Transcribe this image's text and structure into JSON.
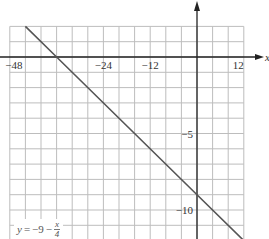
{
  "chart_data": {
    "type": "line",
    "title": "",
    "equation": "y = -9 - x/4",
    "xlabel": "x",
    "ylabel": "y",
    "xlim": [
      -48,
      12
    ],
    "ylim": [
      -12,
      2
    ],
    "grid": true,
    "x_grid_step": 4,
    "y_grid_step": 1,
    "x_ticks": [
      {
        "value": -48,
        "label": "−48"
      },
      {
        "value": -24,
        "label": "−24"
      },
      {
        "value": -12,
        "label": "−12"
      },
      {
        "value": 12,
        "label": "12"
      }
    ],
    "y_ticks": [
      {
        "value": -5,
        "label": "−5"
      },
      {
        "value": -10,
        "label": "−10"
      }
    ],
    "series": [
      {
        "name": "y = -9 - x/4",
        "x": [
          -44,
          -36,
          0,
          12
        ],
        "y": [
          2,
          0,
          -9,
          -12
        ],
        "color": "#555555"
      }
    ],
    "legend": {
      "position": "bottom-left",
      "lhs": "y",
      "eq": "=",
      "const": "−9",
      "minus": "−",
      "frac_num": "x",
      "frac_den": "4"
    }
  },
  "colors": {
    "grid": "#bdbdbd",
    "axis": "#222222",
    "line": "#555555"
  }
}
